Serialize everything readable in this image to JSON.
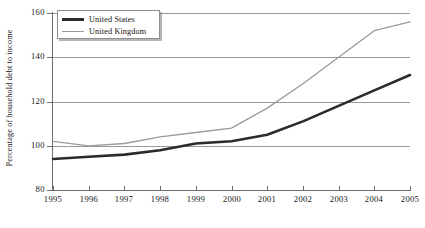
{
  "chart_data": {
    "type": "line",
    "title": "",
    "xlabel": "",
    "ylabel": "Percentage of household debt to income",
    "x": [
      1995,
      1996,
      1997,
      1998,
      1999,
      2000,
      2001,
      2002,
      2003,
      2004,
      2005
    ],
    "xtick_labels": [
      "1995",
      "1996",
      "1997",
      "1998",
      "1999",
      "2000",
      "2001",
      "2002",
      "2003",
      "2004",
      "2005"
    ],
    "ytick_labels": [
      "80",
      "100",
      "120",
      "140",
      "160"
    ],
    "ytick_values": [
      80,
      100,
      120,
      140,
      160
    ],
    "ylim": [
      80,
      160
    ],
    "xlim": [
      1995,
      2005
    ],
    "grid": true,
    "grid_axis": "y",
    "legend_position": "top-left",
    "series": [
      {
        "name": "United States",
        "color": "#2b2b2b",
        "width": 2.6,
        "values": [
          94,
          95,
          96,
          98,
          101,
          102,
          105,
          111,
          118,
          125,
          132
        ]
      },
      {
        "name": "United Kingdom",
        "color": "#9b9b9b",
        "width": 1.3,
        "values": [
          102,
          100,
          101,
          104,
          106,
          108,
          117,
          128,
          140,
          152,
          156
        ]
      }
    ]
  },
  "legend": {
    "items": [
      {
        "label": "United States",
        "swatch": "thick-dark-line"
      },
      {
        "label": "United Kingdom",
        "swatch": "thin-gray-line"
      }
    ]
  },
  "colors": {
    "united_states": "#2b2b2b",
    "united_kingdom": "#9b9b9b",
    "gridline": "#9a9a9a",
    "axis": "#6d6d6d",
    "background": "#ffffff",
    "text": "#141414"
  }
}
